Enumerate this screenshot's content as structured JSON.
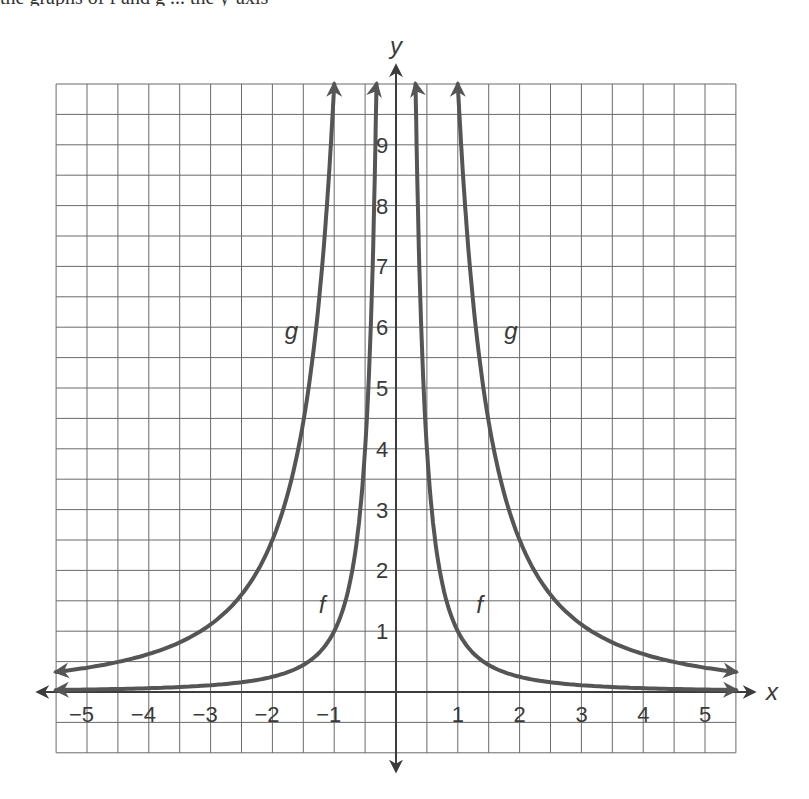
{
  "header": {
    "clipped_text": "the graphs of f and g ... the y-axis"
  },
  "chart_data": {
    "type": "line",
    "title": "",
    "xlabel": "x",
    "ylabel": "y",
    "xlim": [
      -5.5,
      5.5
    ],
    "ylim": [
      -1,
      10
    ],
    "grid": true,
    "grid_step": 0.5,
    "x_ticks": [
      -5,
      -4,
      -3,
      -2,
      -1,
      1,
      2,
      3,
      4,
      5
    ],
    "x_tick_labels": [
      "−5",
      "−4",
      "−3",
      "−2",
      "−1",
      "1",
      "2",
      "3",
      "4",
      "5"
    ],
    "y_ticks": [
      1,
      2,
      3,
      4,
      5,
      6,
      7,
      8,
      9
    ],
    "y_tick_labels": [
      "1",
      "2",
      "3",
      "4",
      "5",
      "6",
      "7",
      "8",
      "9"
    ],
    "legend": "none (curves labeled inline)",
    "series": [
      {
        "name": "f",
        "formula": "y = 1/x^2",
        "color": "#555555",
        "points": [
          [
            -5.5,
            0.03
          ],
          [
            -5,
            0.04
          ],
          [
            -4,
            0.06
          ],
          [
            -3,
            0.11
          ],
          [
            -2,
            0.25
          ],
          [
            -1.5,
            0.44
          ],
          [
            -1,
            1
          ],
          [
            -0.5,
            4
          ],
          [
            -0.316,
            10
          ],
          [
            0.316,
            10
          ],
          [
            0.5,
            4
          ],
          [
            1,
            1
          ],
          [
            1.5,
            0.44
          ],
          [
            2,
            0.25
          ],
          [
            3,
            0.11
          ],
          [
            4,
            0.06
          ],
          [
            5,
            0.04
          ],
          [
            5.5,
            0.03
          ]
        ],
        "labels": [
          {
            "text": "f",
            "x": -1.25,
            "y": 1.3
          },
          {
            "text": "f",
            "x": 1.3,
            "y": 1.3
          }
        ]
      },
      {
        "name": "g",
        "formula": "y = 10/x^2",
        "color": "#555555",
        "points": [
          [
            -5.5,
            0.33
          ],
          [
            -5,
            0.4
          ],
          [
            -4,
            0.63
          ],
          [
            -3,
            1.11
          ],
          [
            -2,
            2.5
          ],
          [
            -1.5,
            4.44
          ],
          [
            -1,
            10
          ],
          [
            1,
            10
          ],
          [
            1.5,
            4.44
          ],
          [
            2,
            2.5
          ],
          [
            3,
            1.11
          ],
          [
            4,
            0.63
          ],
          [
            5,
            0.4
          ],
          [
            5.5,
            0.33
          ]
        ],
        "labels": [
          {
            "text": "g",
            "x": -1.8,
            "y": 5.8
          },
          {
            "text": "g",
            "x": 1.75,
            "y": 5.8
          }
        ]
      }
    ]
  }
}
